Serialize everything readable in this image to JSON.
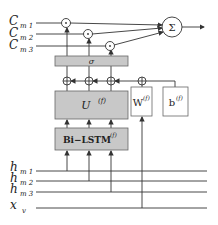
{
  "diagram": {
    "inputs_top": [
      {
        "main": "C",
        "sub": "m 1"
      },
      {
        "main": "C",
        "sub": "m 2"
      },
      {
        "main": "C",
        "sub": "m 3"
      }
    ],
    "inputs_bottom": [
      {
        "main": "h",
        "sub": "m 1"
      },
      {
        "main": "h",
        "sub": "m 2"
      },
      {
        "main": "h",
        "sub": "m 3"
      },
      {
        "main": "x",
        "sub": "v"
      }
    ],
    "multiply_symbol": "·",
    "sum_symbol": "Σ",
    "add_symbol": "+",
    "sigma_label": "σ",
    "u_box": {
      "label": "U",
      "sup": "(f)"
    },
    "w_box": {
      "label": "W",
      "sup": "(f)"
    },
    "b_box": {
      "label": "b",
      "sup": "(f)"
    },
    "lstm_box": {
      "label": "Bi−LSTM",
      "sup": "(f)"
    },
    "colors": {
      "box_fill": "#c8c8c8",
      "line": "#333333",
      "box_stroke": "#666666"
    }
  }
}
